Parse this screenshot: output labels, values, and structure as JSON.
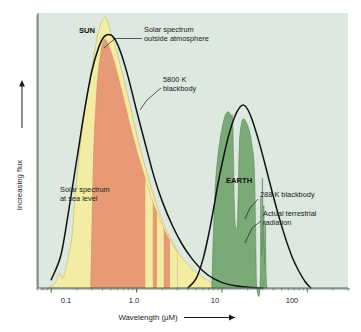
{
  "figure": {
    "background_color": "#ffffff",
    "plot_background_color": "#dde8e0",
    "frame_color": "#6f7d75"
  },
  "axis": {
    "y_label": "Increasing flux",
    "y_arrow": "up-arrow",
    "x_label": "Wavelength (μM)",
    "x_arrow": "right-arrow",
    "x_ticks": [
      "0.1",
      "1.0",
      "10",
      "100"
    ]
  },
  "annotations": {
    "sun": "SUN",
    "earth": "EARTH",
    "solar_outside_l1": "Solar spectrum",
    "solar_outside_l2": "outside atmosphere",
    "blackbody_5800_l1": "5800 K",
    "blackbody_5800_l2": "blackbody",
    "solar_sea_l1": "Solar spectrum",
    "solar_sea_l2": "at sea level",
    "blackbody_288": "288 K blackbody",
    "terrestrial_l1": "Actual terrestrial",
    "terrestrial_l2": "radiation"
  },
  "colors": {
    "solar_outside": "#f2eda2",
    "solar_sea_level": "#e89a77",
    "terrestrial": "#7aab77",
    "curve": "#111111"
  },
  "chart_data": {
    "type": "area",
    "title": "",
    "xlabel": "Wavelength (μM)",
    "ylabel": "Increasing flux",
    "xscale": "log",
    "xlim": [
      0.07,
      300
    ],
    "ylim": [
      0,
      1.0
    ],
    "grid": false,
    "legend": "none",
    "x_tick_values": [
      0.1,
      1.0,
      10,
      100
    ],
    "series": [
      {
        "name": "5800 K blackbody",
        "type": "line",
        "color": "#111111",
        "points": [
          [
            0.1,
            0.03
          ],
          [
            0.13,
            0.12
          ],
          [
            0.16,
            0.28
          ],
          [
            0.2,
            0.47
          ],
          [
            0.25,
            0.66
          ],
          [
            0.3,
            0.79
          ],
          [
            0.36,
            0.875
          ],
          [
            0.42,
            0.915
          ],
          [
            0.5,
            0.92
          ],
          [
            0.58,
            0.895
          ],
          [
            0.68,
            0.84
          ],
          [
            0.8,
            0.765
          ],
          [
            1.0,
            0.645
          ],
          [
            1.25,
            0.53
          ],
          [
            1.6,
            0.405
          ],
          [
            2.0,
            0.315
          ],
          [
            2.6,
            0.23
          ],
          [
            3.4,
            0.16
          ],
          [
            4.5,
            0.105
          ],
          [
            6.0,
            0.062
          ],
          [
            8.0,
            0.034
          ],
          [
            11.0,
            0.016
          ],
          [
            15.0,
            0.007
          ],
          [
            22.0,
            0.002
          ],
          [
            30.0,
            0.0
          ]
        ]
      },
      {
        "name": "Solar spectrum outside atmosphere",
        "type": "area",
        "color": "#f2eda2",
        "points": [
          [
            0.09,
            0.0
          ],
          [
            0.11,
            0.015
          ],
          [
            0.125,
            0.055
          ],
          [
            0.135,
            0.035
          ],
          [
            0.145,
            0.06
          ],
          [
            0.16,
            0.12
          ],
          [
            0.175,
            0.19
          ],
          [
            0.19,
            0.33
          ],
          [
            0.21,
            0.47
          ],
          [
            0.235,
            0.6
          ],
          [
            0.26,
            0.69
          ],
          [
            0.29,
            0.78
          ],
          [
            0.32,
            0.855
          ],
          [
            0.35,
            0.92
          ],
          [
            0.385,
            0.965
          ],
          [
            0.42,
            0.985
          ],
          [
            0.45,
            0.975
          ],
          [
            0.5,
            0.93
          ],
          [
            0.55,
            0.89
          ],
          [
            0.62,
            0.83
          ],
          [
            0.72,
            0.75
          ],
          [
            0.85,
            0.655
          ],
          [
            1.0,
            0.56
          ],
          [
            1.2,
            0.465
          ],
          [
            1.45,
            0.375
          ],
          [
            1.75,
            0.295
          ],
          [
            2.1,
            0.23
          ],
          [
            2.6,
            0.17
          ],
          [
            3.2,
            0.122
          ],
          [
            4.0,
            0.085
          ],
          [
            5.2,
            0.052
          ],
          [
            6.8,
            0.028
          ],
          [
            8.5,
            0.012
          ],
          [
            10.5,
            0.004
          ],
          [
            12.5,
            0.0
          ]
        ]
      },
      {
        "name": "Solar spectrum at sea level",
        "type": "area",
        "color": "#e89a77",
        "points": [
          [
            0.29,
            0.0
          ],
          [
            0.31,
            0.43
          ],
          [
            0.33,
            0.64
          ],
          [
            0.35,
            0.76
          ],
          [
            0.375,
            0.845
          ],
          [
            0.4,
            0.89
          ],
          [
            0.43,
            0.905
          ],
          [
            0.46,
            0.89
          ],
          [
            0.5,
            0.86
          ],
          [
            0.55,
            0.82
          ],
          [
            0.6,
            0.775
          ],
          [
            0.66,
            0.725
          ],
          [
            0.73,
            0.67
          ],
          [
            0.82,
            0.605
          ],
          [
            0.92,
            0.545
          ],
          [
            1.05,
            0.48
          ],
          [
            1.2,
            0.42
          ],
          [
            1.35,
            0.37
          ],
          [
            1.5,
            0.325
          ],
          [
            1.7,
            0.28
          ],
          [
            1.95,
            0.235
          ],
          [
            2.25,
            0.195
          ],
          [
            2.6,
            0.16
          ],
          [
            3.0,
            0.128
          ]
        ],
        "absorption_bands": [
          {
            "center": 1.4,
            "width_frac": 0.1
          },
          {
            "center": 1.9,
            "width_frac": 0.09
          },
          {
            "center": 2.75,
            "width_frac": 0.11
          }
        ]
      },
      {
        "name": "288 K blackbody",
        "type": "line",
        "color": "#111111",
        "points": [
          [
            4.0,
            0.0
          ],
          [
            5.0,
            0.035
          ],
          [
            6.0,
            0.105
          ],
          [
            7.0,
            0.195
          ],
          [
            8.0,
            0.29
          ],
          [
            9.0,
            0.38
          ],
          [
            10.5,
            0.48
          ],
          [
            12.0,
            0.555
          ],
          [
            14.0,
            0.62
          ],
          [
            16.0,
            0.655
          ],
          [
            18.0,
            0.665
          ],
          [
            20.0,
            0.65
          ],
          [
            23.0,
            0.605
          ],
          [
            27.0,
            0.535
          ],
          [
            32.0,
            0.45
          ],
          [
            38.0,
            0.36
          ],
          [
            45.0,
            0.275
          ],
          [
            55.0,
            0.185
          ],
          [
            67.0,
            0.11
          ],
          [
            80.0,
            0.06
          ],
          [
            95.0,
            0.022
          ],
          [
            110.0,
            0.0
          ]
        ]
      },
      {
        "name": "Actual terrestrial radiation",
        "type": "area",
        "color": "#7aab77",
        "points": [
          [
            7.6,
            0.0
          ],
          [
            8.0,
            0.23
          ],
          [
            8.4,
            0.38
          ],
          [
            8.9,
            0.47
          ],
          [
            9.4,
            0.53
          ],
          [
            10.0,
            0.58
          ],
          [
            10.6,
            0.615
          ],
          [
            11.2,
            0.635
          ],
          [
            12.0,
            0.64
          ],
          [
            12.8,
            0.625
          ],
          [
            13.4,
            0.6
          ],
          [
            14.0,
            0.3
          ],
          [
            14.6,
            0.215
          ],
          [
            15.3,
            0.26
          ],
          [
            16.0,
            0.52
          ],
          [
            17.0,
            0.6
          ],
          [
            18.0,
            0.615
          ],
          [
            19.5,
            0.6
          ],
          [
            21.0,
            0.57
          ],
          [
            22.5,
            0.52
          ],
          [
            24.0,
            0.43
          ],
          [
            25.0,
            0.15
          ],
          [
            25.6,
            0.0
          ],
          [
            28.0,
            0.0
          ],
          [
            28.6,
            0.33
          ],
          [
            29.2,
            0.12
          ],
          [
            29.8,
            0.4
          ],
          [
            30.4,
            0.15
          ],
          [
            31.0,
            0.3
          ],
          [
            31.6,
            0.09
          ],
          [
            32.2,
            0.24
          ],
          [
            33.0,
            0.04
          ],
          [
            34.0,
            0.0
          ]
        ]
      }
    ]
  }
}
